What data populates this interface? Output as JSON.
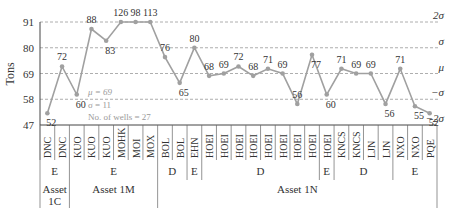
{
  "chart_data": {
    "type": "line",
    "title": "",
    "xlabel": "",
    "ylabel": "Tons",
    "ylim": [
      47,
      91
    ],
    "yticks": [
      47,
      58,
      69,
      80,
      91
    ],
    "grid": "horizontal dashed at sigma levels",
    "sigma_lines": [
      {
        "label": "2σ",
        "value": 91
      },
      {
        "label": "σ",
        "value": 80
      },
      {
        "label": "μ",
        "value": 69
      },
      {
        "label": "−σ",
        "value": 58
      },
      {
        "label": "−2σ",
        "value": 47
      }
    ],
    "stats": {
      "mu": "μ = 69",
      "sigma": "σ = 11",
      "wells": "No. of wells = 27"
    },
    "categories": [
      "DNC",
      "DNC",
      "KUO",
      "KUO",
      "KUO",
      "MOHK",
      "MOI",
      "MOX",
      "BOL",
      "BOL",
      "EHN",
      "HOEI",
      "HOEI",
      "HOEI",
      "HOEI",
      "HOEI",
      "HOEI",
      "HOEI",
      "HOEI",
      "HOEI",
      "KNCS",
      "KNCS",
      "LJN",
      "LJN",
      "NXO",
      "NXO",
      "PQE"
    ],
    "values": [
      52,
      72,
      60,
      88,
      83,
      126,
      98,
      113,
      76,
      65,
      80,
      68,
      69,
      72,
      68,
      71,
      69,
      56,
      77,
      60,
      71,
      69,
      69,
      56,
      71,
      55,
      52
    ],
    "type_groups": [
      {
        "label": "E",
        "start": 0,
        "count": 2
      },
      {
        "label": "E",
        "start": 2,
        "count": 6
      },
      {
        "label": "D",
        "start": 8,
        "count": 2
      },
      {
        "label": "E",
        "start": 10,
        "count": 1
      },
      {
        "label": "D",
        "start": 11,
        "count": 8
      },
      {
        "label": "E",
        "start": 19,
        "count": 1
      },
      {
        "label": "D",
        "start": 20,
        "count": 4
      },
      {
        "label": "E",
        "start": 24,
        "count": 3
      }
    ],
    "asset_groups": [
      {
        "label": "Asset 1C",
        "start": 0,
        "count": 2
      },
      {
        "label": "Asset 1M",
        "start": 2,
        "count": 6
      },
      {
        "label": "Asset 1N",
        "start": 8,
        "count": 19
      }
    ],
    "series_color": "#a0a0a0"
  }
}
